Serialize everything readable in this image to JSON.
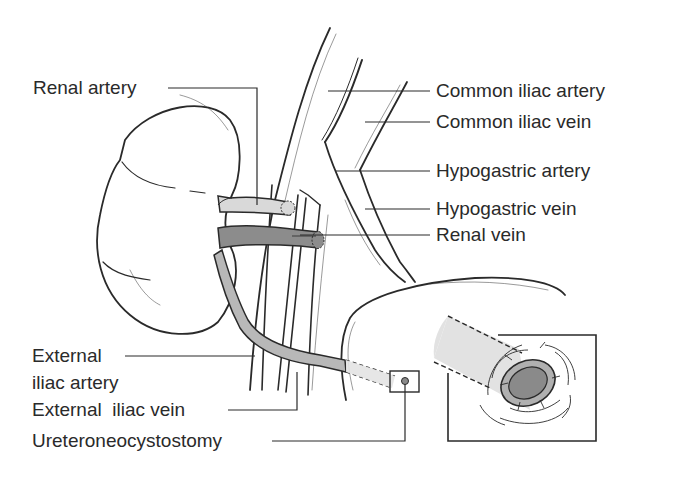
{
  "diagram": {
    "labels": {
      "renal_artery": "Renal artery",
      "common_iliac_artery": "Common iliac artery",
      "common_iliac_vein": "Common iliac vein",
      "hypogastric_artery": "Hypogastric artery",
      "hypogastric_vein": "Hypogastric vein",
      "renal_vein": "Renal vein",
      "external_iliac_artery_line1": "External",
      "external_iliac_artery_line2": "iliac artery",
      "external_iliac_vein": "External  iliac vein",
      "ureteroneocystostomy": "Ureteroneocystostomy"
    },
    "colors": {
      "line": "#2a2a2a",
      "artery_fill": "#d9d9d9",
      "vein_fill": "#8c8c8c",
      "ureter_fill": "#b8b8b8",
      "inset_tube_fill": "#dedede",
      "inset_lumen_fill": "#8a8a8a",
      "background": "#ffffff"
    }
  }
}
